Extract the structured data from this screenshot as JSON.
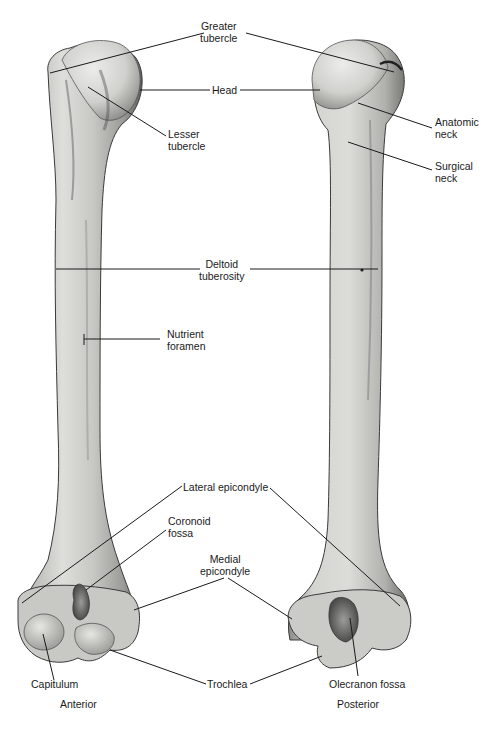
{
  "figure": {
    "views": [
      {
        "id": "anterior",
        "label": "Anterior"
      },
      {
        "id": "posterior",
        "label": "Posterior"
      }
    ],
    "colors": {
      "bone_base": "#c9c9c6",
      "bone_light": "#e2e2df",
      "bone_shadow": "#7d7d7a",
      "outline": "#3a3a3a",
      "leader_line": "#1a1a1a",
      "background": "#ffffff"
    }
  },
  "labels": {
    "greater_tubercle": {
      "line1": "Greater",
      "line2": "tubercle"
    },
    "head": {
      "line1": "Head"
    },
    "lesser_tubercle": {
      "line1": "Lesser",
      "line2": "tubercle"
    },
    "anatomic_neck": {
      "line1": "Anatomic",
      "line2": "neck"
    },
    "surgical_neck": {
      "line1": "Surgical",
      "line2": "neck"
    },
    "deltoid_tuberosity": {
      "line1": "Deltoid",
      "line2": "tuberosity"
    },
    "nutrient_foramen": {
      "line1": "Nutrient",
      "line2": "foramen"
    },
    "lateral_epicondyle": {
      "line1": "Lateral epicondyle"
    },
    "coronoid_fossa": {
      "line1": "Coronoid",
      "line2": "fossa"
    },
    "medial_epicondyle": {
      "line1": "Medial",
      "line2": "epicondyle"
    },
    "capitulum": {
      "line1": "Capitulum"
    },
    "trochlea": {
      "line1": "Trochlea"
    },
    "olecranon_fossa": {
      "line1": "Olecranon fossa"
    }
  }
}
